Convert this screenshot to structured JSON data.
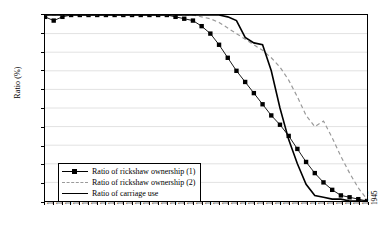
{
  "chart_data": {
    "type": "line",
    "title": "",
    "xlabel": "",
    "ylabel": "Ratio (%)",
    "ylim": [
      0,
      100
    ],
    "ytick_labels": [
      "0",
      "10",
      "20",
      "30",
      "40",
      "50",
      "60",
      "70",
      "80",
      "90",
      "100"
    ],
    "xlim": [
      1871,
      1945
    ],
    "grid": "horizontal",
    "legend_position": "lower-left-inside",
    "categories": [
      1871,
      1873,
      1875,
      1877,
      1879,
      1881,
      1883,
      1885,
      1887,
      1889,
      1891,
      1893,
      1895,
      1897,
      1899,
      1901,
      1903,
      1905,
      1907,
      1909,
      1911,
      1913,
      1915,
      1917,
      1919,
      1921,
      1923,
      1925,
      1927,
      1929,
      1931,
      1933,
      1935,
      1937,
      1939,
      1941,
      1943,
      1945
    ],
    "xtick_labels": [
      "1871",
      "1873",
      "1875",
      "1877",
      "1879",
      "1881",
      "1883",
      "1885",
      "1887",
      "1889",
      "1891",
      "1893",
      "1895",
      "1897",
      "1899",
      "1901",
      "1903",
      "1905",
      "1907",
      "1909",
      "1911",
      "1913",
      "1915",
      "1917",
      "1919",
      "1921",
      "1923",
      "1925",
      "1927",
      "1929",
      "1931",
      "1933",
      "1935",
      "1937",
      "1939",
      "1941",
      "1943",
      "1945"
    ],
    "series": [
      {
        "name": "Ratio of rickshaw ownership (1)",
        "style": "line-marker",
        "marker": "square",
        "color": "#000000",
        "values": [
          99,
          97,
          99,
          100,
          100,
          100,
          100,
          100,
          100,
          100,
          100,
          100,
          100,
          100,
          100,
          99,
          98,
          97,
          94,
          90,
          84,
          77,
          70,
          64,
          58,
          52,
          46,
          41,
          35,
          28,
          21,
          15,
          10,
          6,
          3,
          2,
          1,
          0
        ]
      },
      {
        "name": "Ratio of rickshaw ownership (2)",
        "style": "dashed",
        "color": "#9a9a9a",
        "values": [
          100,
          100,
          100,
          100,
          100,
          100,
          100,
          100,
          100,
          100,
          100,
          100,
          100,
          100,
          100,
          100,
          100,
          100,
          99,
          98,
          96,
          93,
          90,
          87,
          84,
          81,
          77,
          72,
          65,
          56,
          46,
          40,
          43,
          34,
          24,
          15,
          7,
          1
        ]
      },
      {
        "name": "Ratio of carriage use",
        "style": "solid",
        "color": "#000000",
        "values": [
          100,
          100,
          100,
          100,
          100,
          100,
          100,
          100,
          100,
          100,
          100,
          100,
          100,
          100,
          100,
          100,
          100,
          100,
          100,
          100,
          100,
          99,
          97,
          88,
          85,
          84,
          70,
          50,
          33,
          20,
          9,
          3,
          2,
          1,
          1,
          0,
          0,
          0
        ]
      }
    ]
  }
}
